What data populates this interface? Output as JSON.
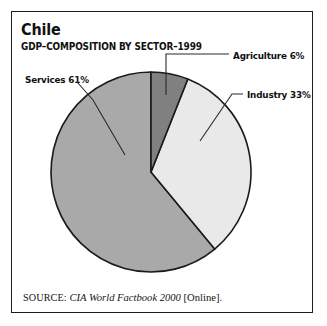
{
  "figure": {
    "title": "Chile",
    "subtitle": "GDP–COMPOSITION BY SECTOR–1999",
    "source": {
      "label": "SOURCE:",
      "work": "CIA World Factbook 2000",
      "suffix": "[Online]."
    }
  },
  "colors": {
    "agriculture": "#808080",
    "industry": "#e9e9e9",
    "services": "#a9a9a9",
    "outline": "#1a1a1a",
    "frame": "#1c1c1c",
    "background": "#ffffff",
    "text": "#111111"
  },
  "labels": {
    "agriculture": "Agriculture 6%",
    "industry": "Industry 33%",
    "services": "Services 61%"
  },
  "chart_data": {
    "type": "pie",
    "title": "Chile",
    "subtitle": "GDP–COMPOSITION BY SECTOR–1999",
    "xlabel": "",
    "ylabel": "",
    "unit": "percent",
    "total": 100,
    "start_angle_deg": 0,
    "direction": "clockwise",
    "legend": "callout-labels",
    "grid": false,
    "categories": [
      "Agriculture",
      "Industry",
      "Services"
    ],
    "values": [
      6,
      33,
      61
    ],
    "slices": [
      {
        "name": "Agriculture",
        "value": 6,
        "label": "Agriculture 6%",
        "color": "#808080",
        "start_deg": 0,
        "end_deg": 21.6
      },
      {
        "name": "Industry",
        "value": 33,
        "label": "Industry 33%",
        "color": "#e9e9e9",
        "start_deg": 21.6,
        "end_deg": 140.4
      },
      {
        "name": "Services",
        "value": 61,
        "label": "Services 61%",
        "color": "#a9a9a9",
        "start_deg": 140.4,
        "end_deg": 360
      }
    ]
  }
}
